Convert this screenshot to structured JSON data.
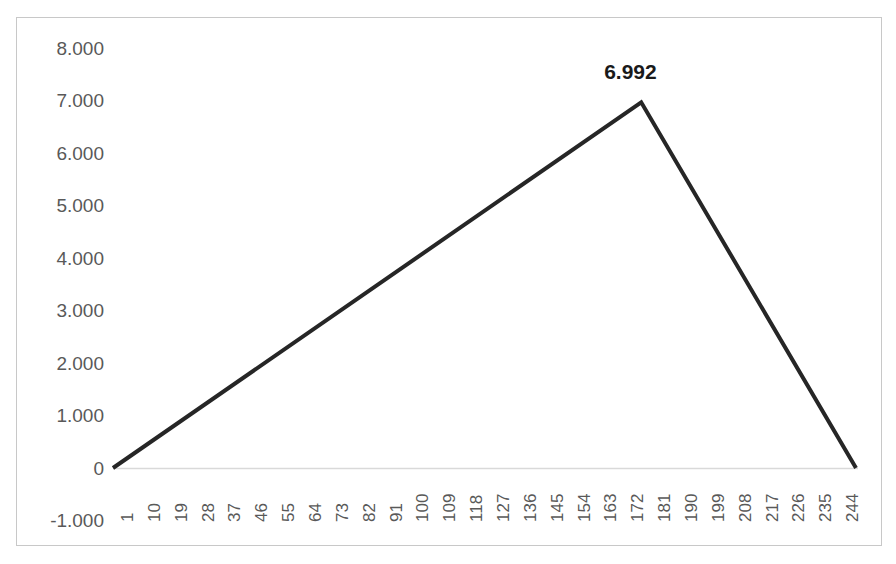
{
  "chart_data": {
    "type": "line",
    "title": "",
    "subtitle": "",
    "xlabel": "",
    "ylabel": "",
    "grid": false,
    "legend": "none",
    "xlim": [
      1,
      250
    ],
    "ylim": [
      -1.0,
      8.0
    ],
    "y_ticks": [
      "8.000",
      "7.000",
      "6.000",
      "5.000",
      "4.000",
      "3.000",
      "2.000",
      "1.000",
      "0",
      "-1.000"
    ],
    "y_tick_values": [
      8.0,
      7.0,
      6.0,
      5.0,
      4.0,
      3.0,
      2.0,
      1.0,
      0.0,
      -1.0
    ],
    "x_ticks": [
      "1",
      "10",
      "19",
      "28",
      "37",
      "46",
      "55",
      "64",
      "73",
      "82",
      "91",
      "100",
      "109",
      "118",
      "127",
      "136",
      "145",
      "154",
      "163",
      "172",
      "181",
      "190",
      "199",
      "208",
      "217",
      "226",
      "235",
      "244"
    ],
    "x_tick_values": [
      1,
      10,
      19,
      28,
      37,
      46,
      55,
      64,
      73,
      82,
      91,
      100,
      109,
      118,
      127,
      136,
      145,
      154,
      163,
      172,
      181,
      190,
      199,
      208,
      217,
      226,
      235,
      244
    ],
    "annotations": [
      {
        "text": "6.992",
        "x": 178,
        "y": 6.992,
        "bold": true
      }
    ],
    "peak_value": 6.992,
    "peak_x": 178,
    "series": [
      {
        "name": "series-1",
        "color": "#262626",
        "line_width": 4,
        "x": [
          1,
          178,
          250
        ],
        "values": [
          0.0,
          6.992,
          0.0
        ]
      }
    ]
  },
  "axis": {
    "zero_line_color": "#d9d9d9",
    "tick_label_color": "#595959",
    "border_color": "#c8c8c8"
  },
  "clipped_header_text": ""
}
